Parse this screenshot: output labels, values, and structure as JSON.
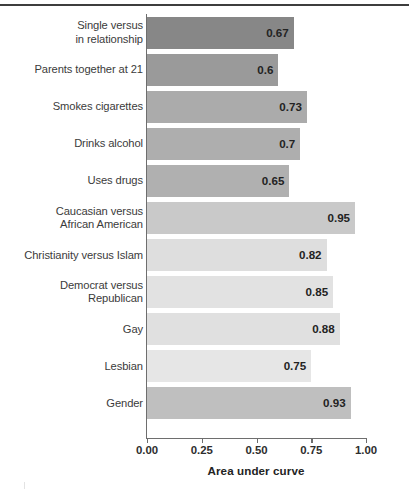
{
  "chart_data": {
    "type": "bar",
    "orientation": "horizontal",
    "title": "",
    "xlabel": "Area under curve",
    "ylabel": "",
    "xlim": [
      0.0,
      1.0
    ],
    "grid": false,
    "legend": null,
    "xticks": [
      "0.00",
      "0.25",
      "0.50",
      "0.75",
      "1.00"
    ],
    "xtick_values": [
      0.0,
      0.25,
      0.5,
      0.75,
      1.0
    ],
    "categories": [
      "Single versus in relationship",
      "Parents together at 21",
      "Smokes cigarettes",
      "Drinks alcohol",
      "Uses drugs",
      "Caucasian versus African American",
      "Christianity versus Islam",
      "Democrat versus Republican",
      "Gay",
      "Lesbian",
      "Gender"
    ],
    "values": [
      0.67,
      0.6,
      0.73,
      0.7,
      0.65,
      0.95,
      0.82,
      0.85,
      0.88,
      0.75,
      0.93
    ],
    "value_labels": [
      "0.67",
      "0.6",
      "0.73",
      "0.7",
      "0.65",
      "0.95",
      "0.82",
      "0.85",
      "0.88",
      "0.75",
      "0.93"
    ],
    "bar_colors": [
      "#878787",
      "#9a9a9a",
      "#ababab",
      "#aeaeae",
      "#b0b0b0",
      "#c9c9c9",
      "#dedede",
      "#e2e2e2",
      "#e0e0e0",
      "#e6e6e6",
      "#bfbfbf"
    ]
  },
  "bars": [
    {
      "label_line1": "Single versus",
      "label_line2": "in relationship",
      "value_label": "0.67"
    },
    {
      "label_line1": "Parents together at 21",
      "label_line2": "",
      "value_label": "0.6"
    },
    {
      "label_line1": "Smokes cigarettes",
      "label_line2": "",
      "value_label": "0.73"
    },
    {
      "label_line1": "Drinks alcohol",
      "label_line2": "",
      "value_label": "0.7"
    },
    {
      "label_line1": "Uses drugs",
      "label_line2": "",
      "value_label": "0.65"
    },
    {
      "label_line1": "Caucasian versus",
      "label_line2": "African American",
      "value_label": "0.95"
    },
    {
      "label_line1": "Christianity versus Islam",
      "label_line2": "",
      "value_label": "0.82"
    },
    {
      "label_line1": "Democrat versus",
      "label_line2": "Republican",
      "value_label": "0.85"
    },
    {
      "label_line1": "Gay",
      "label_line2": "",
      "value_label": "0.88"
    },
    {
      "label_line1": "Lesbian",
      "label_line2": "",
      "value_label": "0.75"
    },
    {
      "label_line1": "Gender",
      "label_line2": "",
      "value_label": "0.93"
    }
  ],
  "axis": {
    "x_title": "Area under curve",
    "ticks": [
      "0.00",
      "0.25",
      "0.50",
      "0.75",
      "1.00"
    ]
  },
  "colors": {
    "axis": "#6e6e6e",
    "text": "#3b3b3b",
    "value_text": "#232323",
    "top_rule": "#3d3d3d",
    "background": "#ffffff"
  }
}
